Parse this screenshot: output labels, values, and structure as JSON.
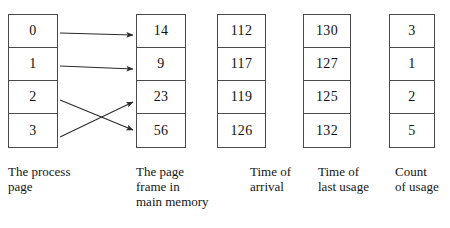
{
  "diagram": {
    "type": "page-replacement-table",
    "columns": [
      {
        "id": "process-page",
        "caption": "The process\npage",
        "values": [
          "0",
          "1",
          "2",
          "3"
        ]
      },
      {
        "id": "page-frame",
        "caption": "The page\nframe in\nmain memory",
        "values": [
          "14",
          "9",
          "23",
          "56"
        ]
      },
      {
        "id": "time-arrival",
        "caption": "Time of\narrival",
        "values": [
          "112",
          "117",
          "119",
          "126"
        ]
      },
      {
        "id": "time-last-usage",
        "caption": "Time of\nlast usage",
        "values": [
          "130",
          "127",
          "125",
          "132"
        ]
      },
      {
        "id": "count-usage",
        "caption": "Count\nof usage",
        "values": [
          "3",
          "1",
          "2",
          "5"
        ]
      }
    ],
    "arrows": [
      {
        "name": "arrow-page-0-to-frame-14",
        "from_row": 0,
        "to_row": 0,
        "x1": 60,
        "y1": 33,
        "x2": 133,
        "y2": 35
      },
      {
        "name": "arrow-page-1-to-frame-9",
        "from_row": 1,
        "to_row": 1,
        "x1": 60,
        "y1": 66,
        "x2": 133,
        "y2": 69
      },
      {
        "name": "arrow-page-2-to-frame-56",
        "from_row": 2,
        "to_row": 3,
        "x1": 60,
        "y1": 100,
        "x2": 133,
        "y2": 130
      },
      {
        "name": "arrow-page-3-to-frame-23",
        "from_row": 3,
        "to_row": 2,
        "x1": 60,
        "y1": 137,
        "x2": 133,
        "y2": 102
      }
    ],
    "style": {
      "line_color": "#4a4a4a",
      "arrow_color": "#2b2b2b",
      "text_color": "#111111",
      "background": "#ffffff"
    }
  }
}
